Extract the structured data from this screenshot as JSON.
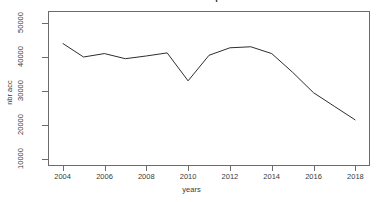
{
  "chart_data": {
    "type": "line",
    "title": "Nombre d'accidents par annee",
    "xlabel": "years",
    "ylabel": "nbr acc",
    "x": [
      2004,
      2005,
      2006,
      2007,
      2008,
      2009,
      2010,
      2011,
      2012,
      2013,
      2014,
      2015,
      2016,
      2017,
      2018
    ],
    "values": [
      44000,
      40000,
      41000,
      39500,
      40300,
      41200,
      33000,
      40500,
      42700,
      43000,
      41000,
      35500,
      29500,
      25500,
      21500
    ],
    "series": [
      {
        "name": "nbr acc",
        "values": [
          44000,
          40000,
          41000,
          39500,
          40300,
          41200,
          33000,
          40500,
          42700,
          43000,
          41000,
          35500,
          29500,
          25500,
          21500
        ]
      }
    ],
    "xlim": [
      2003.3,
      2018.7
    ],
    "ylim": [
      8000,
      53500
    ],
    "xticks": [
      2004,
      2006,
      2008,
      2010,
      2012,
      2014,
      2016,
      2018
    ],
    "yticks": [
      10000,
      20000,
      30000,
      40000,
      50000
    ],
    "xtick_labels": [
      "2004",
      "2006",
      "2008",
      "2010",
      "2012",
      "2014",
      "2016",
      "2018"
    ],
    "ytick_labels": [
      "10000",
      "20000",
      "30000",
      "40000",
      "50000"
    ],
    "grid": false,
    "legend": false,
    "line_color": "#2e2e2e",
    "frame_color": "#6b6b6b",
    "background": "#ffffff"
  }
}
